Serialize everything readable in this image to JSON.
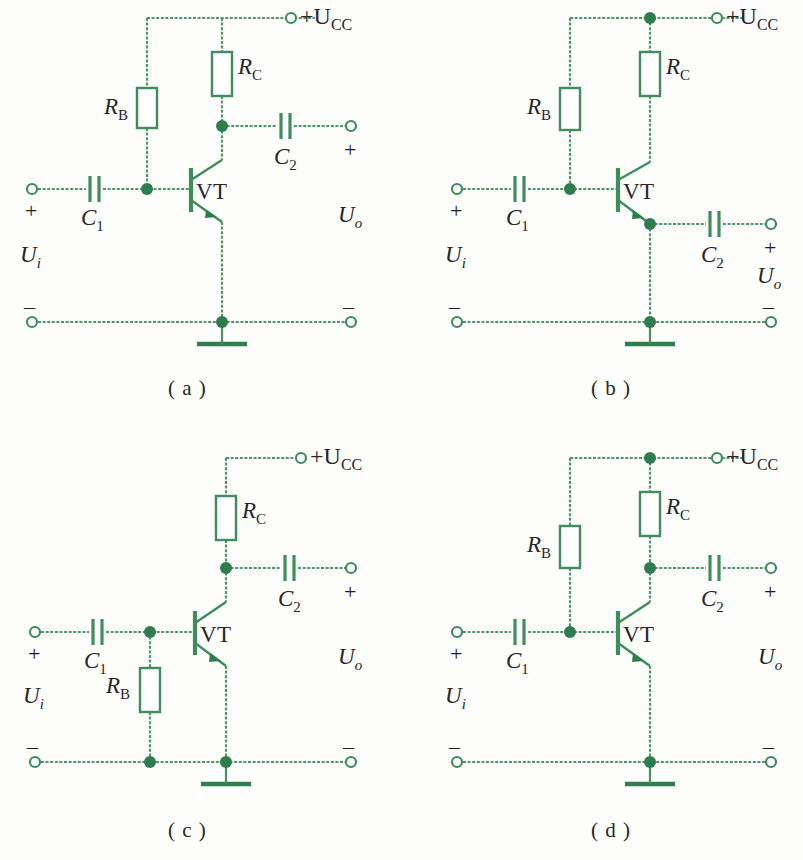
{
  "figure": {
    "background_color": "#fdfdfb",
    "wire_color": "#3f8c5c",
    "node_color": "#2f7d4e",
    "text_color": "#262626",
    "panel_count": 4
  },
  "labels": {
    "supply": "+U",
    "supply_sub": "CC",
    "resistor_b": "R",
    "resistor_b_sub": "B",
    "resistor_c": "R",
    "resistor_c_sub": "C",
    "cap_1": "C",
    "cap_1_sub": "1",
    "cap_2": "C",
    "cap_2_sub": "2",
    "transistor": "VT",
    "u_in": "U",
    "u_in_sub": "i",
    "u_out": "U",
    "u_out_sub": "o",
    "plus": "+",
    "minus": "–"
  },
  "panels": [
    {
      "id": "a",
      "caption": "( a )",
      "configuration": "common-emitter",
      "output_from": "collector",
      "rb_position": "supply-rail-to-base",
      "top_junction_dot": false,
      "components": [
        "R_B",
        "R_C",
        "C_1",
        "C_2",
        "VT"
      ],
      "terminals": [
        "+U_CC",
        "U_i +",
        "U_i –",
        "U_o +",
        "U_o –"
      ]
    },
    {
      "id": "b",
      "caption": "( b )",
      "configuration": "common-collector (emitter follower)",
      "output_from": "emitter",
      "rb_position": "supply-rail-to-base",
      "top_junction_dot": true,
      "components": [
        "R_B",
        "R_C",
        "C_1",
        "C_2",
        "VT"
      ],
      "terminals": [
        "+U_CC",
        "U_i +",
        "U_i –",
        "U_o +",
        "U_o –"
      ]
    },
    {
      "id": "c",
      "caption": "( c )",
      "configuration": "base-to-ground bias",
      "output_from": "collector",
      "rb_position": "base-to-ground-rail",
      "top_junction_dot": false,
      "components": [
        "R_B",
        "R_C",
        "C_1",
        "C_2",
        "VT"
      ],
      "terminals": [
        "+U_CC",
        "U_i +",
        "U_i –",
        "U_o +",
        "U_o –"
      ]
    },
    {
      "id": "d",
      "caption": "( d )",
      "configuration": "common-emitter",
      "output_from": "collector",
      "rb_position": "supply-rail-to-base",
      "top_junction_dot": true,
      "components": [
        "R_B",
        "R_C",
        "C_1",
        "C_2",
        "VT"
      ],
      "terminals": [
        "+U_CC",
        "U_i +",
        "U_i –",
        "U_o +",
        "U_o –"
      ]
    }
  ]
}
